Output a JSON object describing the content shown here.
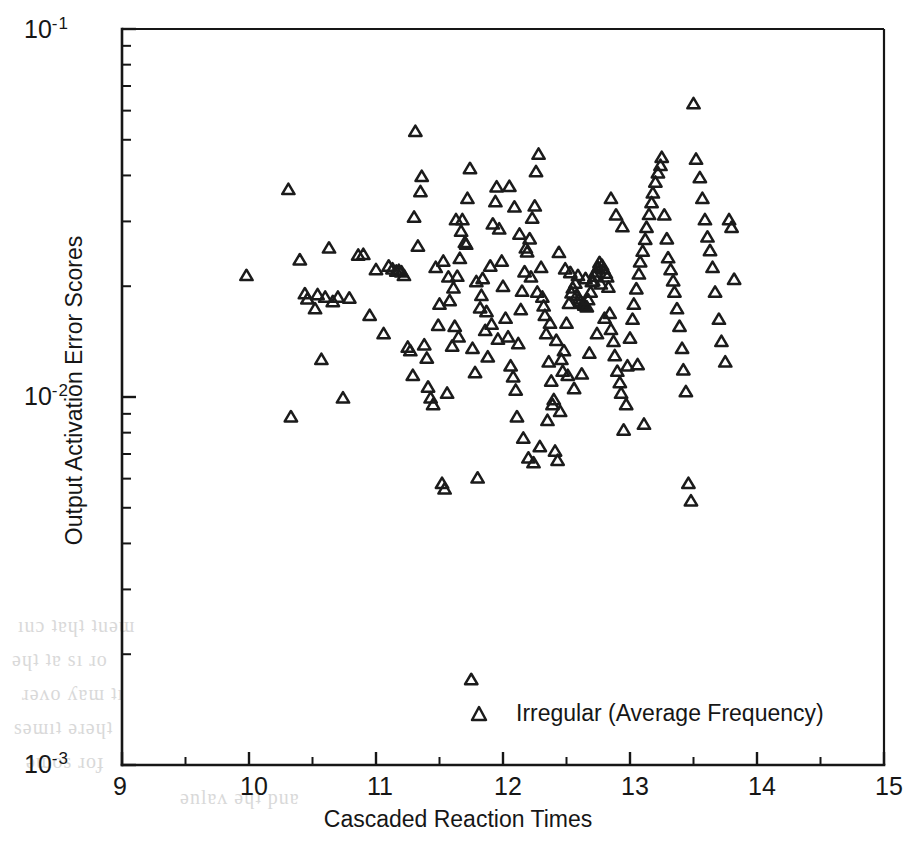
{
  "chart_data": {
    "type": "scatter",
    "title": "",
    "xlabel": "Cascaded Reaction Times",
    "ylabel": "Output Activation Error Scores",
    "xscale": "linear",
    "yscale": "log",
    "xlim": [
      9,
      15
    ],
    "ylim": [
      0.001,
      0.1
    ],
    "grid": false,
    "xticks": [
      9,
      10,
      11,
      12,
      13,
      14,
      15
    ],
    "xtick_labels": [
      "9",
      "10",
      "11",
      "12",
      "13",
      "14",
      "15"
    ],
    "x_minor_tick_step": 0.5,
    "ytick_labels": [
      "10-1",
      "10-2",
      "10-3"
    ],
    "ytick_mantissa": "10",
    "ytick_exponents": [
      "-1",
      "-2",
      "-3"
    ],
    "legend_position": "inside-bottom-center",
    "marker": "triangle-up-open",
    "marker_color": "#1b1b1b",
    "series": [
      {
        "name": "Irregular (Average Frequency)",
        "points": [
          [
            9.98,
            0.0213
          ],
          [
            10.31,
            0.0365
          ],
          [
            10.33,
            0.0088
          ],
          [
            10.4,
            0.0235
          ],
          [
            10.44,
            0.019
          ],
          [
            10.46,
            0.0184
          ],
          [
            10.52,
            0.0173
          ],
          [
            10.54,
            0.0189
          ],
          [
            10.57,
            0.0126
          ],
          [
            10.6,
            0.0186
          ],
          [
            10.63,
            0.0253
          ],
          [
            10.66,
            0.0181
          ],
          [
            10.7,
            0.0186
          ],
          [
            10.74,
            0.0099
          ],
          [
            10.79,
            0.0185
          ],
          [
            10.86,
            0.0242
          ],
          [
            10.9,
            0.0243
          ],
          [
            10.95,
            0.0166
          ],
          [
            11.0,
            0.0221
          ],
          [
            11.06,
            0.0148
          ],
          [
            11.1,
            0.0226
          ],
          [
            11.13,
            0.0222
          ],
          [
            11.16,
            0.0219
          ],
          [
            11.18,
            0.022
          ],
          [
            11.2,
            0.0218
          ],
          [
            11.22,
            0.0213
          ],
          [
            11.25,
            0.0136
          ],
          [
            11.27,
            0.0133
          ],
          [
            11.29,
            0.0114
          ],
          [
            11.3,
            0.0307
          ],
          [
            11.31,
            0.0525
          ],
          [
            11.33,
            0.0256
          ],
          [
            11.35,
            0.036
          ],
          [
            11.36,
            0.0396
          ],
          [
            11.38,
            0.0138
          ],
          [
            11.4,
            0.0127
          ],
          [
            11.41,
            0.0106
          ],
          [
            11.43,
            0.0099
          ],
          [
            11.45,
            0.0095
          ],
          [
            11.47,
            0.0224
          ],
          [
            11.49,
            0.0156
          ],
          [
            11.5,
            0.0178
          ],
          [
            11.52,
            0.0058
          ],
          [
            11.54,
            0.0056
          ],
          [
            11.56,
            0.0102
          ],
          [
            11.58,
            0.0182
          ],
          [
            11.6,
            0.0137
          ],
          [
            11.62,
            0.0155
          ],
          [
            11.64,
            0.0212
          ],
          [
            11.66,
            0.0237
          ],
          [
            11.68,
            0.0302
          ],
          [
            11.7,
            0.0262
          ],
          [
            11.72,
            0.0345
          ],
          [
            11.74,
            0.0416
          ],
          [
            11.75,
            0.0017
          ],
          [
            11.76,
            0.0135
          ],
          [
            11.78,
            0.0116
          ],
          [
            11.8,
            0.006
          ],
          [
            11.82,
            0.0174
          ],
          [
            11.84,
            0.0209
          ],
          [
            11.86,
            0.0151
          ],
          [
            11.88,
            0.0128
          ],
          [
            11.9,
            0.0226
          ],
          [
            11.92,
            0.0294
          ],
          [
            11.94,
            0.0338
          ],
          [
            11.95,
            0.0371
          ],
          [
            11.97,
            0.0285
          ],
          [
            11.99,
            0.0233
          ],
          [
            12.0,
            0.0199
          ],
          [
            12.02,
            0.0163
          ],
          [
            12.04,
            0.0145
          ],
          [
            12.06,
            0.0121
          ],
          [
            12.08,
            0.0113
          ],
          [
            12.1,
            0.0104
          ],
          [
            12.12,
            0.0139
          ],
          [
            12.14,
            0.0172
          ],
          [
            12.15,
            0.0193
          ],
          [
            12.17,
            0.0218
          ],
          [
            12.19,
            0.0247
          ],
          [
            12.21,
            0.0268
          ],
          [
            12.23,
            0.0305
          ],
          [
            12.25,
            0.0329
          ],
          [
            12.26,
            0.0408
          ],
          [
            12.28,
            0.0455
          ],
          [
            12.3,
            0.0224
          ],
          [
            12.31,
            0.0186
          ],
          [
            12.33,
            0.0166
          ],
          [
            12.34,
            0.0148
          ],
          [
            12.36,
            0.0124
          ],
          [
            12.38,
            0.011
          ],
          [
            12.39,
            0.0095
          ],
          [
            12.41,
            0.0071
          ],
          [
            12.43,
            0.0067
          ],
          [
            12.45,
            0.0091
          ],
          [
            12.47,
            0.0117
          ],
          [
            12.48,
            0.0133
          ],
          [
            12.5,
            0.0158
          ],
          [
            12.52,
            0.0179
          ],
          [
            12.54,
            0.0191
          ],
          [
            12.55,
            0.0197
          ],
          [
            12.57,
            0.0203
          ],
          [
            12.58,
            0.0188
          ],
          [
            12.6,
            0.0184
          ],
          [
            12.61,
            0.0181
          ],
          [
            12.63,
            0.0179
          ],
          [
            12.64,
            0.0177
          ],
          [
            12.66,
            0.0175
          ],
          [
            12.67,
            0.0183
          ],
          [
            12.69,
            0.0192
          ],
          [
            12.7,
            0.0205
          ],
          [
            12.72,
            0.0212
          ],
          [
            12.73,
            0.0218
          ],
          [
            12.75,
            0.0224
          ],
          [
            12.76,
            0.0231
          ],
          [
            12.78,
            0.0227
          ],
          [
            12.79,
            0.0222
          ],
          [
            12.81,
            0.0216
          ],
          [
            12.82,
            0.0211
          ],
          [
            12.84,
            0.0168
          ],
          [
            12.85,
            0.0152
          ],
          [
            12.87,
            0.0141
          ],
          [
            12.88,
            0.0129
          ],
          [
            12.9,
            0.0117
          ],
          [
            12.92,
            0.0109
          ],
          [
            12.93,
            0.0102
          ],
          [
            12.95,
            0.0081
          ],
          [
            12.97,
            0.0095
          ],
          [
            12.98,
            0.0121
          ],
          [
            13.0,
            0.0144
          ],
          [
            13.02,
            0.0162
          ],
          [
            13.03,
            0.0178
          ],
          [
            13.05,
            0.0196
          ],
          [
            13.07,
            0.0215
          ],
          [
            13.08,
            0.0232
          ],
          [
            13.1,
            0.0248
          ],
          [
            13.12,
            0.0267
          ],
          [
            13.13,
            0.0288
          ],
          [
            13.15,
            0.0312
          ],
          [
            13.17,
            0.0336
          ],
          [
            13.18,
            0.0357
          ],
          [
            13.2,
            0.0382
          ],
          [
            13.22,
            0.0405
          ],
          [
            13.24,
            0.0424
          ],
          [
            13.25,
            0.0446
          ],
          [
            13.27,
            0.0311
          ],
          [
            13.29,
            0.0268
          ],
          [
            13.3,
            0.0238
          ],
          [
            13.32,
            0.0221
          ],
          [
            13.34,
            0.0206
          ],
          [
            13.35,
            0.0192
          ],
          [
            13.37,
            0.0173
          ],
          [
            13.39,
            0.0155
          ],
          [
            13.41,
            0.0135
          ],
          [
            13.42,
            0.0118
          ],
          [
            13.44,
            0.0103
          ],
          [
            13.46,
            0.0058
          ],
          [
            13.48,
            0.0052
          ],
          [
            13.5,
            0.0624
          ],
          [
            13.52,
            0.0441
          ],
          [
            13.55,
            0.0393
          ],
          [
            13.57,
            0.0345
          ],
          [
            13.59,
            0.0302
          ],
          [
            13.61,
            0.0271
          ],
          [
            13.63,
            0.0249
          ],
          [
            13.65,
            0.0224
          ],
          [
            13.67,
            0.0192
          ],
          [
            13.7,
            0.0162
          ],
          [
            13.72,
            0.0141
          ],
          [
            13.75,
            0.0124
          ],
          [
            13.78,
            0.0302
          ],
          [
            13.8,
            0.0288
          ],
          [
            13.82,
            0.0208
          ],
          [
            12.05,
            0.0372
          ],
          [
            12.09,
            0.0327
          ],
          [
            12.13,
            0.0276
          ],
          [
            12.18,
            0.0253
          ],
          [
            12.22,
            0.0211
          ],
          [
            12.27,
            0.0192
          ],
          [
            12.32,
            0.0176
          ],
          [
            12.37,
            0.0158
          ],
          [
            12.42,
            0.0142
          ],
          [
            12.46,
            0.0126
          ],
          [
            12.51,
            0.0114
          ],
          [
            12.56,
            0.0105
          ],
          [
            12.62,
            0.0115
          ],
          [
            12.68,
            0.0131
          ],
          [
            12.74,
            0.0148
          ],
          [
            12.8,
            0.0163
          ],
          [
            11.63,
            0.0302
          ],
          [
            11.67,
            0.0281
          ],
          [
            11.71,
            0.0259
          ],
          [
            11.79,
            0.0205
          ],
          [
            11.83,
            0.0188
          ],
          [
            11.87,
            0.017
          ],
          [
            11.91,
            0.0157
          ],
          [
            11.96,
            0.0143
          ],
          [
            12.85,
            0.0345
          ],
          [
            12.89,
            0.0311
          ],
          [
            12.94,
            0.0289
          ],
          [
            13.06,
            0.0122
          ],
          [
            12.44,
            0.0246
          ],
          [
            12.49,
            0.0222
          ],
          [
            12.53,
            0.0217
          ],
          [
            12.59,
            0.0213
          ],
          [
            12.65,
            0.0209
          ],
          [
            12.71,
            0.0206
          ],
          [
            12.77,
            0.0202
          ],
          [
            12.83,
            0.0198
          ],
          [
            11.53,
            0.0233
          ],
          [
            11.57,
            0.0211
          ],
          [
            11.61,
            0.0197
          ],
          [
            11.65,
            0.0145
          ],
          [
            12.11,
            0.0088
          ],
          [
            12.16,
            0.0077
          ],
          [
            12.2,
            0.0068
          ],
          [
            12.24,
            0.0066
          ],
          [
            12.29,
            0.0073
          ],
          [
            12.35,
            0.0086
          ],
          [
            12.4,
            0.0098
          ],
          [
            13.11,
            0.0084
          ]
        ]
      }
    ],
    "legend": [
      {
        "label": "Irregular (Average Frequency)",
        "marker": "triangle-up-open"
      }
    ],
    "n_points": 216
  },
  "axes": {
    "x_title": "Cascaded Reaction Times",
    "y_title": "Output Activation Error Scores"
  }
}
